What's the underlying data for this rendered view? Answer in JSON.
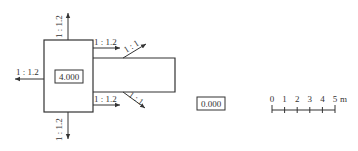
{
  "diagram": {
    "type": "excavation-plan",
    "colors": {
      "line": "#333333",
      "background": "#ffffff"
    },
    "pit": {
      "elevation_label": "4.000"
    },
    "ramp": {
      "slope_top_label": "1 : 1",
      "slope_bottom_label": "1 : 1"
    },
    "slopes": {
      "top": "1 : 1.2",
      "bottom": "1 : 1.2",
      "left": "1 : 1.2",
      "right_upper": "1 : 1.2",
      "right_lower": "1 : 1.2"
    },
    "ground_elevation_label": "0.000",
    "scale_bar": {
      "ticks": [
        "0",
        "1",
        "2",
        "3",
        "4",
        "5"
      ],
      "unit": "m"
    }
  }
}
